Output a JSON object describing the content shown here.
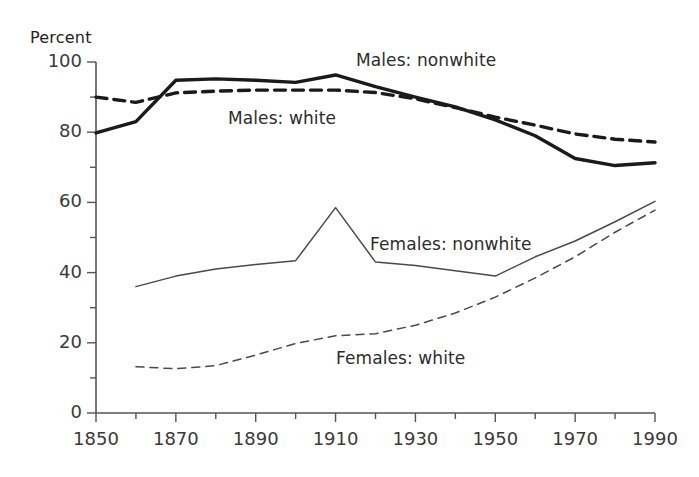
{
  "chart_data": {
    "type": "line",
    "title": "",
    "xlabel": "",
    "ylabel": "Percent",
    "xlim": [
      1850,
      1990
    ],
    "ylim": [
      0,
      100
    ],
    "grid": false,
    "legend_position": "inline-annotations",
    "x_tick_labels": [
      "1850",
      "1870",
      "1890",
      "1910",
      "1930",
      "1950",
      "1970",
      "1990"
    ],
    "x_tick_values": [
      1850,
      1870,
      1890,
      1910,
      1930,
      1950,
      1970,
      1990
    ],
    "x_minor_ticks": [
      1860,
      1880,
      1900,
      1920,
      1940,
      1960,
      1980
    ],
    "y_tick_labels": [
      "0",
      "20",
      "40",
      "60",
      "80",
      "100"
    ],
    "y_tick_values": [
      0,
      20,
      40,
      60,
      80,
      100
    ],
    "y_minor_ticks": [
      10,
      30,
      50,
      70,
      90
    ],
    "series": [
      {
        "name": "Males: nonwhite",
        "style": "solid-thick",
        "color": "#1a1a1a",
        "x": [
          1850,
          1860,
          1870,
          1880,
          1890,
          1900,
          1910,
          1920,
          1930,
          1940,
          1950,
          1960,
          1970,
          1980,
          1990
        ],
        "values": [
          79.8,
          83.0,
          94.8,
          95.2,
          94.8,
          94.2,
          96.3,
          93.0,
          90.0,
          87.2,
          83.5,
          79.0,
          72.5,
          70.5,
          71.3
        ]
      },
      {
        "name": "Males: white",
        "style": "dashed-thick",
        "color": "#1a1a1a",
        "x": [
          1850,
          1860,
          1870,
          1880,
          1890,
          1900,
          1910,
          1920,
          1930,
          1940,
          1950,
          1960,
          1970,
          1980,
          1990
        ],
        "values": [
          90.0,
          88.5,
          91.2,
          91.7,
          92.0,
          92.0,
          92.0,
          91.3,
          89.5,
          87.0,
          84.3,
          82.0,
          79.5,
          78.0,
          77.2
        ]
      },
      {
        "name": "Females: nonwhite",
        "style": "solid-thin",
        "color": "#4a4a4a",
        "x": [
          1860,
          1870,
          1880,
          1890,
          1900,
          1910,
          1920,
          1930,
          1940,
          1950,
          1960,
          1970,
          1980,
          1990
        ],
        "values": [
          36.0,
          39.0,
          41.0,
          42.3,
          43.4,
          58.5,
          43.0,
          42.0,
          40.5,
          39.0,
          44.5,
          49.0,
          54.5,
          60.3
        ]
      },
      {
        "name": "Females: white",
        "style": "dashed-thin",
        "color": "#4a4a4a",
        "x": [
          1860,
          1870,
          1880,
          1890,
          1900,
          1910,
          1920,
          1930,
          1940,
          1950,
          1960,
          1970,
          1980,
          1990
        ],
        "values": [
          13.2,
          12.6,
          13.5,
          16.5,
          19.8,
          22.0,
          22.6,
          25.0,
          28.5,
          33.0,
          38.5,
          44.5,
          51.5,
          57.8
        ]
      }
    ],
    "annotations": [
      {
        "text": "Males: nonwhite",
        "x_px": 356,
        "y_px": 50
      },
      {
        "text": "Males: white",
        "x_px": 228,
        "y_px": 108
      },
      {
        "text": "Females: nonwhite",
        "x_px": 370,
        "y_px": 234
      },
      {
        "text": "Females: white",
        "x_px": 336,
        "y_px": 348
      }
    ]
  }
}
